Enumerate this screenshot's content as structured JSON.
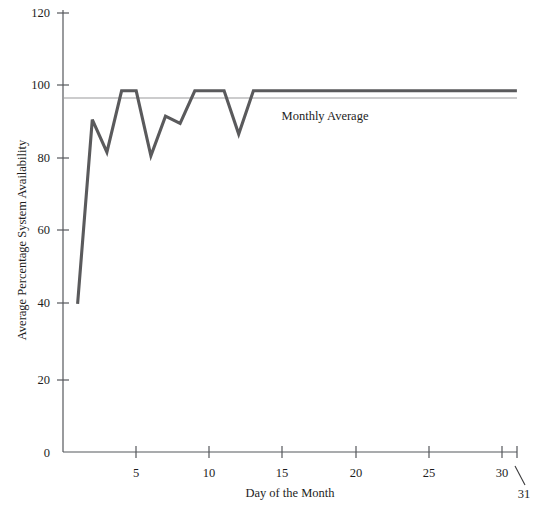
{
  "chart_data": {
    "type": "line",
    "title": "",
    "xlabel": "Day of the Month",
    "ylabel": "Average Percentage System Availability",
    "xlim": [
      0,
      31
    ],
    "ylim": [
      0,
      120
    ],
    "grid": false,
    "legend_position": "inline-annotation",
    "x": [
      1,
      2,
      3,
      4,
      5,
      6,
      7,
      8,
      9,
      10,
      11,
      12,
      13,
      14,
      15,
      16,
      17,
      18,
      19,
      20,
      21,
      22,
      23,
      24,
      25,
      26,
      27,
      28,
      29,
      30,
      31
    ],
    "series": [
      {
        "name": "Average Percentage System Availability",
        "color": "#5a5a5c",
        "values": [
          41,
          92,
          83,
          100,
          100,
          82,
          93,
          91,
          100,
          100,
          100,
          88,
          100,
          100,
          100,
          100,
          100,
          100,
          100,
          100,
          100,
          100,
          100,
          100,
          100,
          100,
          100,
          100,
          100,
          100,
          100
        ]
      }
    ],
    "reference_lines": [
      {
        "name": "Monthly Average",
        "label": "Monthly Average",
        "value": 98,
        "color": "#9a9a9c",
        "orientation": "horizontal"
      }
    ],
    "y_ticks": [
      0,
      20,
      40,
      60,
      80,
      100,
      120
    ],
    "y_tick_labels": [
      "0",
      "20",
      "40",
      "60",
      "80",
      "100",
      "120"
    ],
    "x_ticks": [
      5,
      10,
      15,
      20,
      25,
      30
    ],
    "x_tick_labels": [
      "5",
      "10",
      "15",
      "20",
      "25",
      "30"
    ],
    "x_extra_labels": [
      {
        "name": "day-31-callout",
        "label": "31",
        "value": 31
      }
    ]
  },
  "annotations": {
    "monthly_average_label": "Monthly Average"
  },
  "axes": {
    "x_title": "Day of the Month",
    "y_title": "Average Percentage System Availability"
  }
}
